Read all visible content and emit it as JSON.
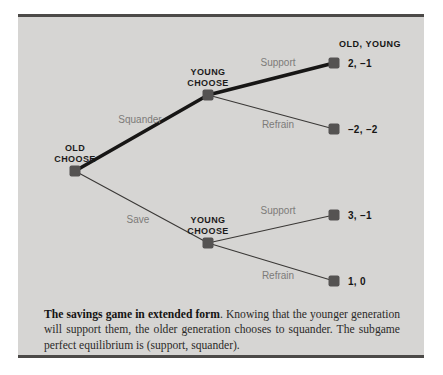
{
  "figure": {
    "panel_background": "#d6d5d3",
    "border_color": "#4c4a48",
    "node_color": "#555352",
    "edge_label_color": "#7d7b79",
    "highlight_edge_color": "#171615",
    "normal_edge_color": "#3a3836"
  },
  "header": {
    "payoff_header": "OLD, YOUNG"
  },
  "nodes": [
    {
      "id": "old_choose",
      "label": "OLD\nCHOOSE",
      "x": 57,
      "y": 154,
      "label_x": 57,
      "label_y": 126
    },
    {
      "id": "young_choose_top",
      "label": "YOUNG\nCHOOSE",
      "x": 190,
      "y": 78,
      "label_x": 190,
      "label_y": 50
    },
    {
      "id": "young_choose_bottom",
      "label": "YOUNG\nCHOOSE",
      "x": 190,
      "y": 226,
      "label_x": 190,
      "label_y": 198
    },
    {
      "id": "terminal_support_top",
      "x": 316,
      "y": 46
    },
    {
      "id": "terminal_refrain_top",
      "x": 316,
      "y": 112
    },
    {
      "id": "terminal_support_bottom",
      "x": 316,
      "y": 198
    },
    {
      "id": "terminal_refrain_bottom",
      "x": 316,
      "y": 264
    }
  ],
  "edges": [
    {
      "id": "squander",
      "label": "Squander",
      "from": "old_choose",
      "to": "young_choose_top",
      "x1": 57,
      "y1": 154,
      "x2": 190,
      "y2": 78,
      "highlighted": true,
      "label_x": 122,
      "label_y": 102
    },
    {
      "id": "save",
      "label": "Save",
      "from": "old_choose",
      "to": "young_choose_bottom",
      "x1": 57,
      "y1": 154,
      "x2": 190,
      "y2": 226,
      "highlighted": false,
      "label_x": 120,
      "label_y": 202
    },
    {
      "id": "support_top",
      "label": "Support",
      "from": "young_choose_top",
      "to": "terminal_support_top",
      "x1": 190,
      "y1": 78,
      "x2": 316,
      "y2": 46,
      "highlighted": true,
      "label_x": 260,
      "label_y": 45
    },
    {
      "id": "refrain_top",
      "label": "Refrain",
      "from": "young_choose_top",
      "to": "terminal_refrain_top",
      "x1": 190,
      "y1": 78,
      "x2": 316,
      "y2": 112,
      "highlighted": false,
      "label_x": 260,
      "label_y": 107
    },
    {
      "id": "support_bottom",
      "label": "Support",
      "from": "young_choose_bottom",
      "to": "terminal_support_bottom",
      "x1": 190,
      "y1": 226,
      "x2": 316,
      "y2": 198,
      "highlighted": false,
      "label_x": 260,
      "label_y": 193
    },
    {
      "id": "refrain_bottom",
      "label": "Refrain",
      "from": "young_choose_bottom",
      "to": "terminal_refrain_bottom",
      "x1": 190,
      "y1": 226,
      "x2": 316,
      "y2": 264,
      "highlighted": false,
      "label_x": 260,
      "label_y": 258
    }
  ],
  "payoffs": [
    {
      "id": "payoff_squander_support",
      "text": "2, –1",
      "x": 330,
      "y": 46
    },
    {
      "id": "payoff_squander_refrain",
      "text": "–2, –2",
      "x": 330,
      "y": 112
    },
    {
      "id": "payoff_save_support",
      "text": "3, –1",
      "x": 330,
      "y": 198
    },
    {
      "id": "payoff_save_refrain",
      "text": "1, 0",
      "x": 330,
      "y": 264
    }
  ],
  "caption": {
    "title": "The savings game in extended form",
    "body": ". Knowing that the younger generation will support them, the older generation chooses to squander.  The subgame perfect equilibrium is (support, squander)."
  },
  "chart_data": {
    "type": "diagram",
    "diagram_kind": "extensive-form-game-tree",
    "players": [
      "OLD",
      "YOUNG"
    ],
    "payoff_order": "OLD, YOUNG",
    "decision_nodes": [
      {
        "name": "OLD CHOOSE",
        "player": "OLD",
        "actions": [
          "Squander",
          "Save"
        ]
      },
      {
        "name": "YOUNG CHOOSE",
        "player": "YOUNG",
        "after": "Squander",
        "actions": [
          "Support",
          "Refrain"
        ]
      },
      {
        "name": "YOUNG CHOOSE",
        "player": "YOUNG",
        "after": "Save",
        "actions": [
          "Support",
          "Refrain"
        ]
      }
    ],
    "outcomes": [
      {
        "path": [
          "Squander",
          "Support"
        ],
        "old": 2,
        "young": -1,
        "label": "2, –1"
      },
      {
        "path": [
          "Squander",
          "Refrain"
        ],
        "old": -2,
        "young": -2,
        "label": "–2, –2"
      },
      {
        "path": [
          "Save",
          "Support"
        ],
        "old": 3,
        "young": -1,
        "label": "3, –1"
      },
      {
        "path": [
          "Save",
          "Refrain"
        ],
        "old": 1,
        "young": 0,
        "label": "1, 0"
      }
    ],
    "equilibrium_path": [
      "Squander",
      "Support"
    ],
    "equilibrium_label": "(support, squander)"
  }
}
